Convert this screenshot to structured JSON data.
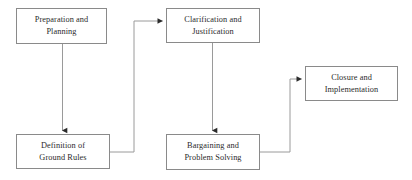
{
  "diagram": {
    "type": "flowchart",
    "colors": {
      "box_border": "#8a8a8a",
      "box_fill": "#ffffff",
      "connector": "#9a9a9a",
      "arrowhead": "#2b2b2b",
      "text": "#2b2b2b",
      "background": "#ffffff"
    },
    "nodes": [
      {
        "id": "preparation",
        "label": "Preparation and\nPlanning",
        "line1": "Preparation and",
        "line2": "Planning",
        "x": 16,
        "y": 8,
        "width": 91,
        "height": 36
      },
      {
        "id": "clarification",
        "label": "Clarification and\nJustification",
        "line1": "Clarification and",
        "line2": "Justification",
        "x": 166,
        "y": 8,
        "width": 94,
        "height": 35
      },
      {
        "id": "closure",
        "label": "Closure and\nImplementation",
        "line1": "Closure and",
        "line2": "Implementation",
        "x": 305,
        "y": 66,
        "width": 93,
        "height": 35
      },
      {
        "id": "definition",
        "label": "Definition of\nGround Rules",
        "line1": "Definition of",
        "line2": "Ground Rules",
        "x": 16,
        "y": 134,
        "width": 94,
        "height": 35
      },
      {
        "id": "bargaining",
        "label": "Bargaining and\nProblem Solving",
        "line1": "Bargaining and",
        "line2": "Problem Solving",
        "x": 166,
        "y": 134,
        "width": 94,
        "height": 36
      }
    ],
    "connectors": [
      {
        "id": "preparation-to-definition",
        "from": "preparation",
        "to": "definition",
        "style": "straight-vertical",
        "path": "M 62.5 44 L 62.5 131",
        "arrow_at": "definition-top"
      },
      {
        "id": "definition-to-clarification",
        "from": "definition",
        "to": "clarification",
        "style": "orthogonal-right-up-right",
        "path": "M 110 152 L 134 152 L 134 21 L 163 21",
        "arrow_at": "clarification-left"
      },
      {
        "id": "clarification-to-bargaining",
        "from": "clarification",
        "to": "bargaining",
        "style": "straight-vertical",
        "path": "M 212.5 43 L 212.5 131",
        "arrow_at": "bargaining-top"
      },
      {
        "id": "bargaining-to-closure",
        "from": "bargaining",
        "to": "closure",
        "style": "orthogonal-right-up-right",
        "path": "M 260 152 L 290 152 L 290 79 L 302 79",
        "arrow_at": "closure-left"
      }
    ]
  }
}
